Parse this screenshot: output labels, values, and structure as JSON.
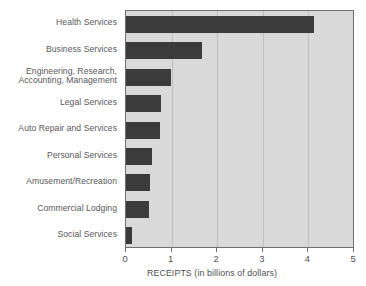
{
  "chart_data": {
    "type": "bar",
    "orientation": "horizontal",
    "title": "",
    "xlabel": "RECEIPTS (in billions of dollars)",
    "ylabel": "",
    "xlim": [
      0,
      5
    ],
    "xticks": [
      "0",
      "1",
      "2",
      "3",
      "4",
      "5"
    ],
    "grid": true,
    "legend": "none",
    "bar_color": "#3b3b3b",
    "plot_background": "#d9d9d9",
    "categories": [
      "Health Services",
      "Business Services",
      "Engineering, Research,\nAccounting, Management",
      "Legal Services",
      "Auto Repair and Services",
      "Personal Services",
      "Amusement/Recreation",
      "Commercial Lodging",
      "Social Services"
    ],
    "values": [
      4.12,
      1.66,
      0.98,
      0.76,
      0.74,
      0.57,
      0.52,
      0.5,
      0.13
    ]
  }
}
